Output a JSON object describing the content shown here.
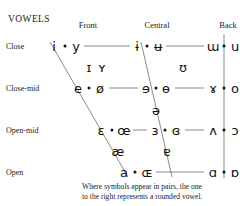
{
  "title": "VOWELS",
  "columns": [
    {
      "label": "Front",
      "x": 88
    },
    {
      "label": "Central",
      "x": 157
    },
    {
      "label": "Back",
      "x": 228
    }
  ],
  "rows": [
    {
      "label": "Close",
      "y": 46
    },
    {
      "label": "Close-mid",
      "y": 88
    },
    {
      "label": "Open-mid",
      "y": 130
    },
    {
      "label": "Open",
      "y": 172
    }
  ],
  "caption": {
    "line1": "Where symbols appear in pairs, the one",
    "line2": "to the right represents a rounded vowel."
  },
  "chart_data": {
    "type": "scatter",
    "title": "VOWELS",
    "xlabel": "Backness",
    "ylabel": "Height",
    "x_categories": [
      "Front",
      "Central",
      "Back"
    ],
    "y_categories": [
      "Close",
      "Near-close",
      "Close-mid",
      "Mid",
      "Open-mid",
      "Near-open",
      "Open"
    ],
    "grid": true,
    "legend": "Where symbols appear in pairs, the one to the right represents a rounded vowel.",
    "points": [
      {
        "symbol": "i",
        "height": "Close",
        "backness": "Front",
        "rounded": false,
        "x": 54,
        "y": 46
      },
      {
        "symbol": "y",
        "height": "Close",
        "backness": "Front",
        "rounded": true,
        "x": 76,
        "y": 46
      },
      {
        "symbol": "ɨ",
        "height": "Close",
        "backness": "Central",
        "rounded": false,
        "x": 137,
        "y": 46
      },
      {
        "symbol": "ʉ",
        "height": "Close",
        "backness": "Central",
        "rounded": true,
        "x": 158,
        "y": 46
      },
      {
        "symbol": "ɯ",
        "height": "Close",
        "backness": "Back",
        "rounded": false,
        "x": 213,
        "y": 46
      },
      {
        "symbol": "u",
        "height": "Close",
        "backness": "Back",
        "rounded": true,
        "x": 235,
        "y": 46
      },
      {
        "symbol": "ɪ",
        "height": "Near-close",
        "backness": "Front",
        "rounded": false,
        "x": 89,
        "y": 67
      },
      {
        "symbol": "ʏ",
        "height": "Near-close",
        "backness": "Front",
        "rounded": true,
        "x": 102,
        "y": 67
      },
      {
        "symbol": "ʊ",
        "height": "Near-close",
        "backness": "Back",
        "rounded": true,
        "x": 183,
        "y": 67
      },
      {
        "symbol": "e",
        "height": "Close-mid",
        "backness": "Front",
        "rounded": false,
        "x": 78,
        "y": 88
      },
      {
        "symbol": "ø",
        "height": "Close-mid",
        "backness": "Front",
        "rounded": true,
        "x": 100,
        "y": 88
      },
      {
        "symbol": "ɘ",
        "height": "Close-mid",
        "backness": "Central",
        "rounded": false,
        "x": 146,
        "y": 88
      },
      {
        "symbol": "ɵ",
        "height": "Close-mid",
        "backness": "Central",
        "rounded": true,
        "x": 166,
        "y": 88
      },
      {
        "symbol": "ɤ",
        "height": "Close-mid",
        "backness": "Back",
        "rounded": false,
        "x": 213,
        "y": 88
      },
      {
        "symbol": "o",
        "height": "Close-mid",
        "backness": "Back",
        "rounded": true,
        "x": 235,
        "y": 88
      },
      {
        "symbol": "ə",
        "height": "Mid",
        "backness": "Central",
        "rounded": false,
        "x": 156,
        "y": 110
      },
      {
        "symbol": "ɛ",
        "height": "Open-mid",
        "backness": "Front",
        "rounded": false,
        "x": 101,
        "y": 130
      },
      {
        "symbol": "œ",
        "height": "Open-mid",
        "backness": "Front",
        "rounded": true,
        "x": 124,
        "y": 130
      },
      {
        "symbol": "ɜ",
        "height": "Open-mid",
        "backness": "Central",
        "rounded": false,
        "x": 155,
        "y": 130
      },
      {
        "symbol": "ɞ",
        "height": "Open-mid",
        "backness": "Central",
        "rounded": true,
        "x": 176,
        "y": 130
      },
      {
        "symbol": "ʌ",
        "height": "Open-mid",
        "backness": "Back",
        "rounded": false,
        "x": 213,
        "y": 130
      },
      {
        "symbol": "ɔ",
        "height": "Open-mid",
        "backness": "Back",
        "rounded": true,
        "x": 235,
        "y": 130
      },
      {
        "symbol": "æ",
        "height": "Near-open",
        "backness": "Front",
        "rounded": false,
        "x": 118,
        "y": 151
      },
      {
        "symbol": "ɐ",
        "height": "Near-open",
        "backness": "Central",
        "rounded": false,
        "x": 167,
        "y": 151
      },
      {
        "symbol": "a",
        "height": "Open",
        "backness": "Front",
        "rounded": false,
        "x": 124,
        "y": 172
      },
      {
        "symbol": "ɶ",
        "height": "Open",
        "backness": "Front",
        "rounded": true,
        "x": 147,
        "y": 172
      },
      {
        "symbol": "ɑ",
        "height": "Open",
        "backness": "Back",
        "rounded": false,
        "x": 213,
        "y": 172
      },
      {
        "symbol": "ɒ",
        "height": "Open",
        "backness": "Back",
        "rounded": true,
        "x": 235,
        "y": 172
      }
    ],
    "pair_dots": [
      {
        "x": 65,
        "y": 46
      },
      {
        "x": 147,
        "y": 46
      },
      {
        "x": 224,
        "y": 46
      },
      {
        "x": 89,
        "y": 88
      },
      {
        "x": 156,
        "y": 88
      },
      {
        "x": 224,
        "y": 88
      },
      {
        "x": 112,
        "y": 130
      },
      {
        "x": 165,
        "y": 130
      },
      {
        "x": 224,
        "y": 130
      },
      {
        "x": 135,
        "y": 172
      },
      {
        "x": 224,
        "y": 172
      }
    ],
    "frame_color": "#5a5a5a",
    "symbol_color": "#111111"
  }
}
